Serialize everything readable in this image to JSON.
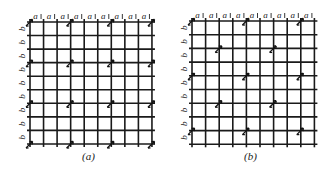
{
  "figure": {
    "panels": [
      {
        "id": "a",
        "caption": "(a)",
        "caption_pos": {
          "x": 82,
          "y": 150
        },
        "origin": {
          "x": 30,
          "y": 22
        },
        "spacing": {
          "x": 13.55,
          "y": 13.55
        },
        "n_vertical_lines": 10,
        "n_horizontal_lines": 10,
        "column_label": "a",
        "row_label": "b",
        "lattice_type": "primitive rectangular",
        "marked_points": [
          [
            0,
            0
          ],
          [
            3,
            0
          ],
          [
            6,
            0
          ],
          [
            9,
            0
          ],
          [
            0,
            3
          ],
          [
            3,
            3
          ],
          [
            6,
            3
          ],
          [
            9,
            3
          ],
          [
            0,
            6
          ],
          [
            3,
            6
          ],
          [
            6,
            6
          ],
          [
            9,
            6
          ],
          [
            0,
            9
          ],
          [
            3,
            9
          ],
          [
            6,
            9
          ],
          [
            9,
            9
          ]
        ]
      },
      {
        "id": "b",
        "caption": "(b)",
        "caption_pos": {
          "x": 244,
          "y": 150
        },
        "origin": {
          "x": 192,
          "y": 21
        },
        "spacing": {
          "x": 13.6,
          "y": 13.7
        },
        "n_vertical_lines": 10,
        "n_horizontal_lines": 10,
        "column_label": "a",
        "row_label": "b",
        "lattice_type": "centered rectangular",
        "marked_points": [
          [
            0,
            0
          ],
          [
            4,
            0
          ],
          [
            8,
            0
          ],
          [
            2,
            2
          ],
          [
            6,
            2
          ],
          [
            0,
            4
          ],
          [
            4,
            4
          ],
          [
            8,
            4
          ],
          [
            2,
            6
          ],
          [
            6,
            6
          ],
          [
            0,
            8
          ],
          [
            4,
            8
          ],
          [
            8,
            8
          ]
        ]
      }
    ]
  }
}
